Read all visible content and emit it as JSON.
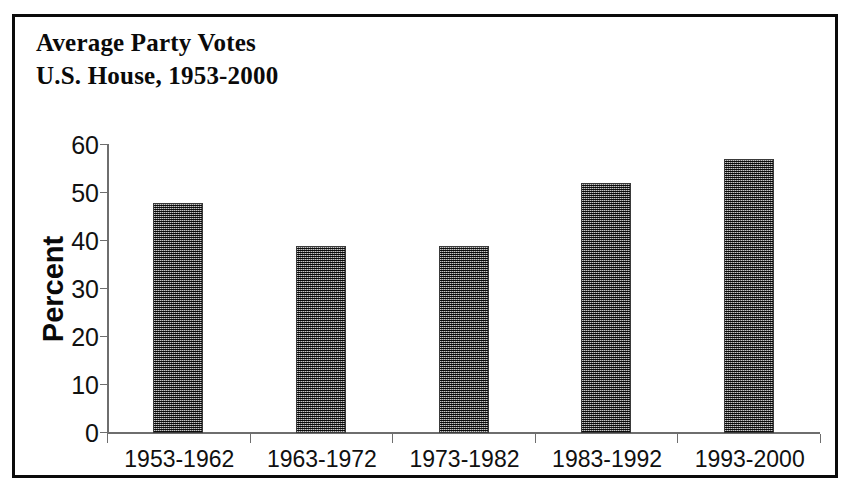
{
  "chart_data": {
    "type": "bar",
    "title": "Average Party Votes U.S. House, 1953-2000",
    "title_lines": [
      "Average Party Votes",
      "U.S. House, 1953-2000"
    ],
    "categories": [
      "1953-1962",
      "1963-1972",
      "1973-1982",
      "1983-1992",
      "1993-2000"
    ],
    "values": [
      48,
      39,
      39,
      52,
      57
    ],
    "xlabel": "",
    "ylabel": "Percent",
    "ylim": [
      0,
      60
    ],
    "ytick_labels": [
      "0",
      "10",
      "20",
      "30",
      "40",
      "50",
      "60"
    ],
    "ytick_values": [
      0,
      10,
      20,
      30,
      40,
      50,
      60
    ],
    "grid": false,
    "legend": false,
    "bar_color": "#6b6b6b",
    "frame_color": "#0b0b0b",
    "axis_color": "#6e6e6e",
    "text_color": "#0a0a0a"
  }
}
